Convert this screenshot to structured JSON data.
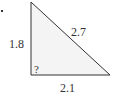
{
  "diagram": {
    "type": "right-triangle",
    "sides": {
      "left": "1.8",
      "hypotenuse": "2.7",
      "bottom": "2.1"
    },
    "unknown_angle_label": "?",
    "colors": {
      "fill": "#f4f4f4",
      "stroke": "#333333",
      "text": "#333333"
    }
  }
}
